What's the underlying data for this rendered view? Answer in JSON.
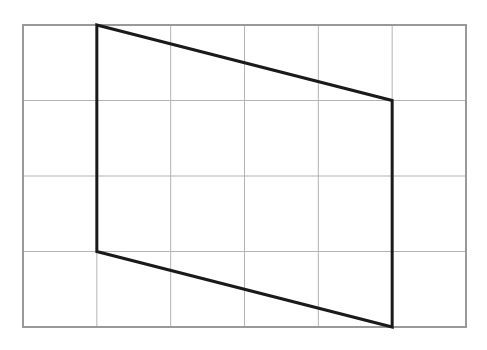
{
  "diagram": {
    "type": "grid-with-quadrilateral",
    "grid": {
      "columns": 6,
      "rows": 4,
      "left": 23,
      "top": 25,
      "right": 466,
      "bottom": 327,
      "line_color": "#b3b3b3",
      "border_color": "#999999"
    },
    "shape": {
      "name": "parallelogram",
      "grid_vertices": [
        [
          1,
          0
        ],
        [
          5,
          1
        ],
        [
          5,
          4
        ],
        [
          1,
          3
        ]
      ],
      "stroke_color": "#1a1a1a",
      "stroke_width": 3
    }
  }
}
